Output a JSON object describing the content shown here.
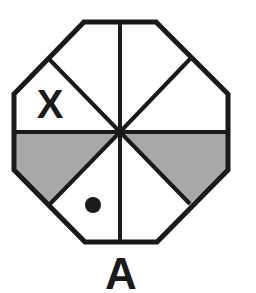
{
  "figure": {
    "label": "A",
    "mark_x": "X",
    "shape": "octagon",
    "sectors": 8,
    "colors": {
      "stroke": "#1a1a1a",
      "shade": "#a8a8a8",
      "background": "#ffffff"
    },
    "shaded_sectors": [
      "left-lower",
      "right-lower"
    ],
    "mark_x_sector": "left-upper",
    "dot_sector": "bottom-left"
  }
}
